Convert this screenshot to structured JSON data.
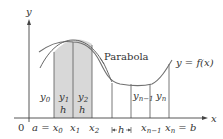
{
  "diagram": {
    "axes": {
      "x_label": "x",
      "y_label": "y",
      "origin_label": "0"
    },
    "curve_label": "y = f(x)",
    "parabola_label": "Parabola",
    "ordinates": [
      {
        "base": "y",
        "sub": "0"
      },
      {
        "base": "y",
        "sub": "1"
      },
      {
        "base": "y",
        "sub": "2"
      },
      {
        "base": "y",
        "sub": "n−1"
      },
      {
        "base": "y",
        "sub": "n"
      }
    ],
    "x_ticks": [
      {
        "text": "a = x",
        "sub": "0"
      },
      {
        "text": "x",
        "sub": "1"
      },
      {
        "text": "x",
        "sub": "2"
      },
      {
        "text": "x",
        "sub": "n−1"
      },
      {
        "text": "x",
        "sub": "n",
        "suffix": " = b"
      }
    ],
    "h_labels": [
      "h",
      "h"
    ],
    "h_interval_label": "h",
    "colors": {
      "curve": "#6d6d6d",
      "shade": "#d6d6d6",
      "lines": "#555555",
      "axes": "#444444"
    }
  }
}
